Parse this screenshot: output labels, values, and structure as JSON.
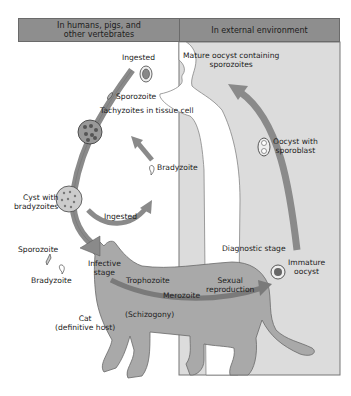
{
  "diagram": {
    "colors": {
      "header_bg": "#8e8e8e",
      "external_panel_bg": "#dcdcdc",
      "cat_fill": "#a9a9a9",
      "arrow_fill": "#8a8a8a"
    },
    "headers": {
      "left": "In humans, pigs, and other vertebrates",
      "left_line1": "In humans, pigs, and",
      "left_line2": "other vertebrates",
      "right": "In external environment"
    },
    "labels": {
      "ingested_top": "Ingested",
      "sporozoite_top": "Sporozoite",
      "tachyzoites": "Tachyzoites in tissue cell",
      "bradyzoite_mid": "Bradyzoite",
      "cyst_line1": "Cyst with",
      "cyst_line2": "bradyzoites",
      "ingested_mid": "Ingested",
      "sporozoite_left": "Sporozoite",
      "bradyzoite_left": "Bradyzoite",
      "infective_line1": "Infective",
      "infective_line2": "stage",
      "trophozoite": "Trophozoite",
      "merozoite": "Merozoite",
      "schizogony": "(Schizogony)",
      "cat_line1": "Cat",
      "cat_line2": "(definitive host)",
      "sexual_line1": "Sexual",
      "sexual_line2": "reproduction",
      "diagnostic": "Diagnostic stage",
      "immature_line1": "Immature",
      "immature_line2": "oocyst",
      "oocyst_sporoblast_line1": "Oocyst with",
      "oocyst_sporoblast_line2": "sporoblast",
      "mature_line1": "Mature oocyst containing",
      "mature_line2": "sporozoites"
    }
  }
}
